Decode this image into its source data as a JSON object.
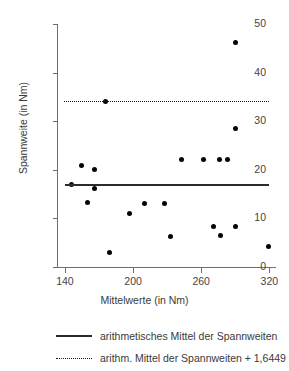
{
  "chart_data": {
    "type": "scatter",
    "title": "",
    "xlabel": "Mittelwerte (in Nm)",
    "ylabel": "Spannweite (in Nm)",
    "xlim": [
      133,
      325
    ],
    "ylim": [
      0,
      50
    ],
    "xticks": [
      140,
      200,
      260,
      320
    ],
    "yticks": [
      0,
      10,
      20,
      30,
      40,
      50
    ],
    "grid": false,
    "points": [
      {
        "x": 146,
        "y": 17.0
      },
      {
        "x": 155,
        "y": 20.9
      },
      {
        "x": 160,
        "y": 13.2
      },
      {
        "x": 166,
        "y": 20.1
      },
      {
        "x": 166,
        "y": 16.1
      },
      {
        "x": 176,
        "y": 34.0
      },
      {
        "x": 179,
        "y": 3.0
      },
      {
        "x": 197,
        "y": 11.1
      },
      {
        "x": 210,
        "y": 13.1
      },
      {
        "x": 228,
        "y": 13.1
      },
      {
        "x": 233,
        "y": 6.2
      },
      {
        "x": 243,
        "y": 22.1
      },
      {
        "x": 262,
        "y": 22.1
      },
      {
        "x": 271,
        "y": 8.3
      },
      {
        "x": 276,
        "y": 22.1
      },
      {
        "x": 277,
        "y": 6.4
      },
      {
        "x": 283,
        "y": 22.1
      },
      {
        "x": 290,
        "y": 46.1
      },
      {
        "x": 290,
        "y": 28.4
      },
      {
        "x": 290,
        "y": 8.3
      },
      {
        "x": 319,
        "y": 4.3
      }
    ],
    "reference_lines": [
      {
        "name": "arithmetisches Mittel der Spannweiten",
        "style": "solid",
        "value": 17.0,
        "x_start": 140,
        "x_end": 320
      },
      {
        "name": "arithm. Mittel der Spannweiten + 1,6449 x s",
        "style": "dotted",
        "value": 34.2,
        "x_start": 139,
        "x_end": 320
      }
    ],
    "legend": {
      "position": "below",
      "entries": [
        {
          "label": "arithmetisches Mittel der Spannweiten",
          "style": "solid"
        },
        {
          "label": "arithm. Mittel der Spannweiten + 1,6449 x s",
          "style": "dotted"
        }
      ]
    },
    "colors": {
      "point": "#050505",
      "mean_line": "#2b2b2b",
      "threshold_line": "#1a1a1a",
      "axis": "#6f6f6f",
      "text": "#3a3a3a",
      "background": "#ffffff"
    }
  }
}
